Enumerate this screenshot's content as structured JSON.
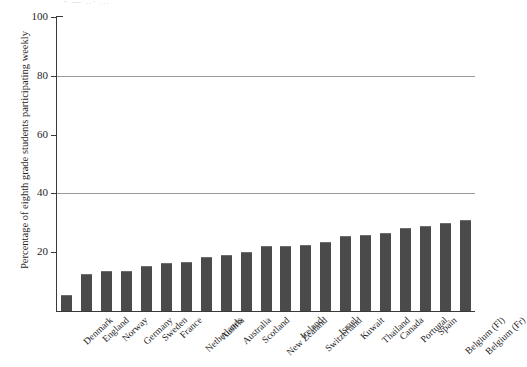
{
  "figure": {
    "top_cropped_text": "- — ..· ...",
    "background_color": "#ffffff",
    "bar_color": "#4a4a4a",
    "axis_color": "#3a3a3a",
    "gridline_color": "#9a9a9a"
  },
  "chart_data": {
    "type": "bar",
    "title": "",
    "xlabel": "",
    "ylabel": "Percentage of eighth grade students participating weekly",
    "ylim": [
      0,
      100
    ],
    "yticks": [
      20,
      40,
      60,
      80,
      100
    ],
    "ytick_labels": [
      "20",
      "40",
      "60",
      "80",
      "100"
    ],
    "gridlines_at": [
      40,
      80
    ],
    "grid": true,
    "legend": false,
    "legend_position": "none",
    "categories": [
      "Denmark",
      "England",
      "Norway",
      "Germany",
      "Sweden",
      "France",
      "Netherlands",
      "Austria",
      "Australia",
      "Scotland",
      "New Zealand",
      "Ireland",
      "Switzerland",
      "Israel",
      "Kuwait",
      "Thailand",
      "Canada",
      "Portugal",
      "Spain",
      "Belgium (Fl)",
      "Belgium (Fr)"
    ],
    "values": [
      5.5,
      12.7,
      13.5,
      13.6,
      15.3,
      16.2,
      16.8,
      18.5,
      18.9,
      20.2,
      22.1,
      22.2,
      22.4,
      23.6,
      25.6,
      25.7,
      26.6,
      28.2,
      28.9,
      30.0,
      30.8
    ]
  }
}
